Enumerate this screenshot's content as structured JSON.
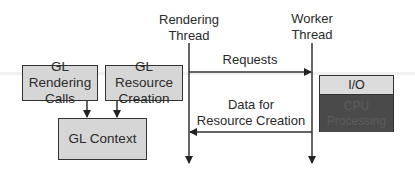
{
  "diagram": {
    "threads": {
      "rendering": {
        "line1": "Rendering",
        "line2": "Thread"
      },
      "worker": {
        "line1": "Worker",
        "line2": "Thread"
      }
    },
    "boxes": {
      "gl_rendering_calls": {
        "line1": "GL Rendering",
        "line2": "Calls"
      },
      "gl_resource_creation": {
        "line1": "GL Resource",
        "line2": "Creation"
      },
      "gl_context": {
        "label": "GL Context"
      },
      "worker_task": {
        "top": "I/O",
        "bottom_line1": "CPU",
        "bottom_line2": "Processing"
      }
    },
    "arrows": {
      "requests": {
        "label": "Requests",
        "direction": "rendering-to-worker"
      },
      "data": {
        "line1": "Data for",
        "line2": "Resource Creation",
        "direction": "worker-to-rendering"
      }
    },
    "colors": {
      "box_fill": "#d6d6d6",
      "io_fill": "#dcdcdc",
      "cpu_fill": "#4a4a4a",
      "line": "#333333"
    }
  }
}
